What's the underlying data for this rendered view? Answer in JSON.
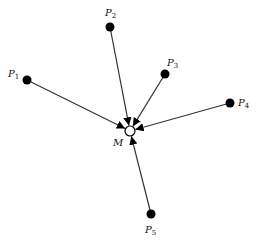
{
  "diagram": {
    "center": {
      "label": "M",
      "x": 130,
      "y": 131,
      "r": 5,
      "label_x": 113,
      "label_y": 146
    },
    "points": [
      {
        "label": "P",
        "sub": "1",
        "x": 27,
        "y": 80,
        "label_x": 8,
        "label_y": 77
      },
      {
        "label": "P",
        "sub": "2",
        "x": 110,
        "y": 27,
        "label_x": 105,
        "label_y": 16
      },
      {
        "label": "P",
        "sub": "3",
        "x": 165,
        "y": 74,
        "label_x": 167,
        "label_y": 66
      },
      {
        "label": "P",
        "sub": "4",
        "x": 230,
        "y": 103,
        "label_x": 238,
        "label_y": 106
      },
      {
        "label": "P",
        "sub": "5",
        "x": 151,
        "y": 214,
        "label_x": 145,
        "label_y": 233
      }
    ],
    "colors": {
      "line": "#333333",
      "dot": "#000000",
      "center_fill": "#ffffff"
    }
  }
}
